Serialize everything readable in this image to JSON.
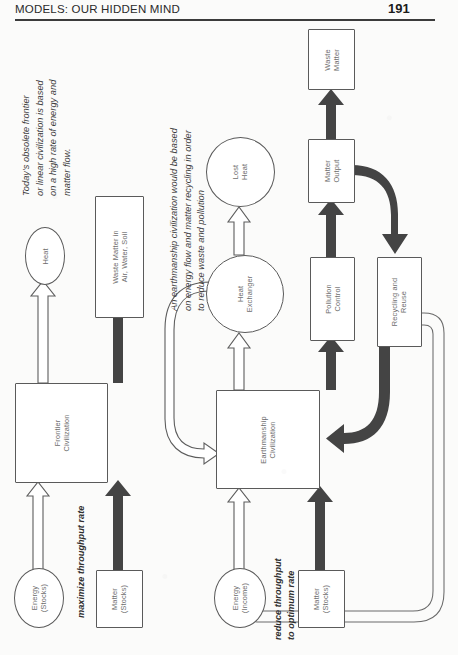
{
  "page": {
    "header_title": "MODELS: OUR HIDDEN MIND",
    "page_number": "191"
  },
  "left_diagram": {
    "caption": "Today's obsolete frontier\nor linear civilization is based\non a high rate of energy and\nmatter flow.",
    "caption_lines": [
      "Today's obsolete frontier",
      "or linear civilization is based",
      "on a high rate of energy and",
      "matter flow."
    ],
    "flow_label": "maximize throughput rate",
    "nodes": {
      "energy_stocks": "Energy\n(Stocks)",
      "energy_stocks_lines": [
        "Energy",
        "(Stocks)"
      ],
      "matter_stocks_lines": [
        "Matter",
        "(Stocks)"
      ],
      "civilization_lines": [
        "Frontier",
        "Civilization"
      ],
      "heat": "Heat",
      "waste_matter_lines": [
        "Waste Matter in",
        "Air, Water, Soil"
      ]
    }
  },
  "right_diagram": {
    "caption_lines": [
      "An earthmanship civilization would be based",
      "on energy flow and matter recycling in order",
      "to reduce waste and pollution"
    ],
    "flow_label_lines": [
      "reduce throughput",
      "to optimum rate"
    ],
    "nodes": {
      "energy_income_lines": [
        "Energy",
        "(Income)"
      ],
      "matter_stocks_lines": [
        "Matter",
        "(Stocks)"
      ],
      "civilization_lines": [
        "Earthmanship",
        "Civilization"
      ],
      "heat_exchanger_lines": [
        "Heat",
        "Exchanger"
      ],
      "lost_heat_lines": [
        "Lost",
        "Heat"
      ],
      "pollution_control_lines": [
        "Pollution",
        "Control"
      ],
      "matter_output_lines": [
        "Matter",
        "Output"
      ],
      "waste_matter_lines": [
        "Waste",
        "Matter"
      ],
      "recycling_reuse_lines": [
        "Recycling and",
        "Reuse"
      ]
    }
  },
  "colors": {
    "energy_flow": "#ffffff",
    "matter_flow": "#444444",
    "node_stroke": "#5a5a5a",
    "text": "#6d6d6d"
  }
}
